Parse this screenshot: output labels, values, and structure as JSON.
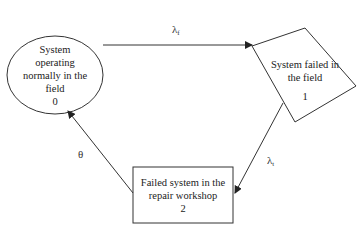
{
  "diagram": {
    "type": "state-transition",
    "nodes": [
      {
        "id": "0",
        "shape": "ellipse",
        "lines": [
          "System",
          "operating",
          "normally in the",
          "field",
          "0"
        ]
      },
      {
        "id": "1",
        "shape": "rotated-rectangle",
        "lines": [
          "System failed in",
          "the field",
          "1"
        ]
      },
      {
        "id": "2",
        "shape": "rectangle",
        "lines": [
          "Failed system in the",
          "repair workshop",
          "2"
        ]
      }
    ],
    "edges": [
      {
        "from": "0",
        "to": "1",
        "symbol": "λ",
        "subscript": "f"
      },
      {
        "from": "1",
        "to": "2",
        "symbol": "λ",
        "subscript": "t"
      },
      {
        "from": "2",
        "to": "0",
        "symbol": "θ",
        "subscript": ""
      }
    ]
  }
}
